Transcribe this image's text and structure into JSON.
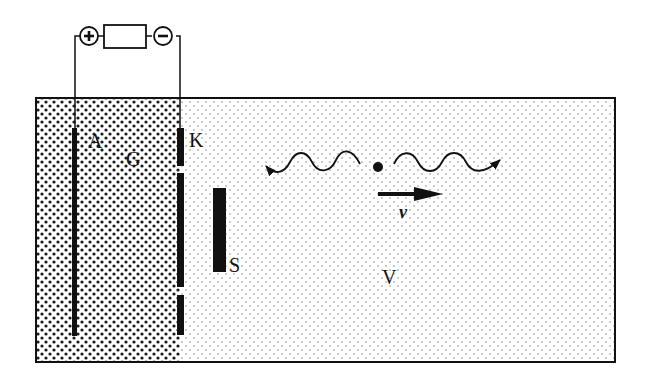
{
  "diagram": {
    "type": "physics-schematic",
    "labels": {
      "anode": "A",
      "gas_region": "G",
      "cathode": "K",
      "screen": "S",
      "vacuum": "V",
      "velocity": "v"
    },
    "power_supply": {
      "positive_terminal": "+",
      "negative_terminal": "−"
    },
    "colors": {
      "ink": "#111111",
      "background": "#ffffff",
      "dense_dot": "#1a1a1a",
      "sparse_dot": "#8a8a8a"
    }
  }
}
